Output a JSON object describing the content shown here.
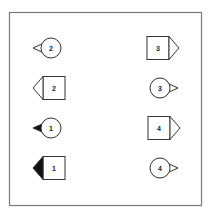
{
  "diagram": {
    "frame": {
      "x": 9,
      "y": 12,
      "width": 193,
      "height": 194,
      "stroke": "#7a7a7a"
    },
    "colors": {
      "stroke": "#333333",
      "fill": "#ffffff",
      "solid": "#111111"
    },
    "symbols": [
      {
        "id": "left-1",
        "column": "left",
        "shape": "circle",
        "pointer": "left",
        "pointer_filled": false,
        "label": "2",
        "cx": 51,
        "cy": 48
      },
      {
        "id": "left-2",
        "column": "left",
        "shape": "square",
        "pointer": "left",
        "pointer_filled": false,
        "label": "2",
        "cx": 54,
        "cy": 88
      },
      {
        "id": "left-3",
        "column": "left",
        "shape": "circle",
        "pointer": "left",
        "pointer_filled": true,
        "label": "1",
        "cx": 51,
        "cy": 128
      },
      {
        "id": "left-4",
        "column": "left",
        "shape": "square",
        "pointer": "left",
        "pointer_filled": true,
        "label": "1",
        "cx": 54,
        "cy": 168
      },
      {
        "id": "right-1",
        "column": "right",
        "shape": "square",
        "pointer": "right",
        "pointer_filled": false,
        "label": "3",
        "cx": 158,
        "cy": 48
      },
      {
        "id": "right-2",
        "column": "right",
        "shape": "circle",
        "pointer": "right",
        "pointer_filled": false,
        "label": "3",
        "cx": 160,
        "cy": 88
      },
      {
        "id": "right-3",
        "column": "right",
        "shape": "square",
        "pointer": "right",
        "pointer_filled": false,
        "label": "4",
        "cx": 159,
        "cy": 128
      },
      {
        "id": "right-4",
        "column": "right",
        "shape": "circle",
        "pointer": "right",
        "pointer_filled": false,
        "label": "4",
        "cx": 160,
        "cy": 168
      }
    ]
  }
}
